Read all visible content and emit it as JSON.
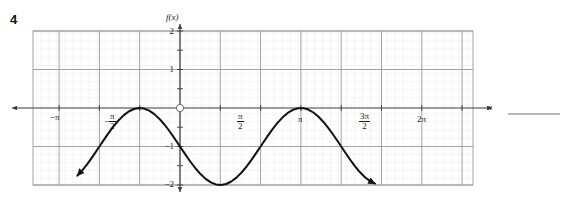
{
  "problem": {
    "number": "4",
    "answer_blank": true
  },
  "chart_data": {
    "type": "line",
    "title": "",
    "xlabel": "x",
    "ylabel": "f(x)",
    "grid": true,
    "legend": false,
    "xlim": [
      -4.0,
      7.6
    ],
    "ylim": [
      -2.0,
      2.0
    ],
    "x_tick_labels": [
      "-π",
      "-π/2",
      "π/2",
      "π",
      "3π/2",
      "2π"
    ],
    "x_tick_values": [
      -3.14159,
      -1.5708,
      1.5708,
      3.14159,
      4.71239,
      6.28319
    ],
    "y_tick_labels": [
      "2",
      "1",
      "-1",
      "-2"
    ],
    "y_tick_values": [
      2,
      1,
      -1,
      -2
    ],
    "origin_label": "O",
    "function": "f(x) = -sin(x) - 1",
    "amplitude": 1,
    "period": 6.28319,
    "vertical_shift": -1,
    "series": [
      {
        "name": "f(x)",
        "color": "#111111",
        "x": [
          -4.0,
          -3.8,
          -3.6,
          -3.4,
          -3.2,
          -3.0,
          -2.8,
          -2.6,
          -2.4,
          -2.2,
          -2.0,
          -1.8,
          -1.6,
          -1.4,
          -1.2,
          -1.0,
          -0.8,
          -0.6,
          -0.4,
          -0.2,
          0.0,
          0.2,
          0.4,
          0.6,
          0.8,
          1.0,
          1.2,
          1.4,
          1.6,
          1.8,
          2.0,
          2.2,
          2.4,
          2.6,
          2.8,
          3.0,
          3.2,
          3.4,
          3.6,
          3.8,
          4.0,
          4.2,
          4.4,
          4.6,
          4.8,
          5.0,
          5.2,
          5.4,
          5.6,
          5.8,
          6.0,
          6.2,
          6.4,
          6.6,
          6.8,
          7.0,
          7.2,
          7.4,
          7.6
        ],
        "y": [
          -1.757,
          -1.612,
          -1.443,
          -1.256,
          -1.058,
          -0.859,
          -0.665,
          -0.485,
          -0.325,
          -0.192,
          -0.091,
          -0.026,
          -0.0,
          -0.015,
          -0.068,
          -0.159,
          -0.283,
          -0.435,
          -0.611,
          -0.801,
          -1.0,
          -1.199,
          -1.389,
          -1.565,
          -1.717,
          -1.841,
          -1.932,
          -1.985,
          -2.0,
          -1.974,
          -1.909,
          -1.808,
          -1.675,
          -1.515,
          -1.335,
          -1.141,
          -0.942,
          -0.745,
          -0.557,
          -0.388,
          -0.243,
          -0.129,
          -0.049,
          -0.006,
          -0.004,
          -0.041,
          -0.117,
          -0.228,
          -0.369,
          -0.536,
          -0.721,
          -0.917,
          -1.116,
          -1.312,
          -1.495,
          -1.657,
          -1.793,
          -1.896,
          -1.963
        ]
      }
    ],
    "curve_arrow_start": true,
    "curve_arrow_end": true,
    "axis_arrow_left": true,
    "axis_arrow_right": true,
    "axis_arrow_up": true,
    "axis_arrow_down": true
  },
  "labels": {
    "x_axis_name": "x",
    "y_axis_name": "f(x)",
    "origin": "O",
    "neg_pi": "−π",
    "neg_pi_over_2_num": "π",
    "neg_pi_over_2_den": "2",
    "pi_over_2_num": "π",
    "pi_over_2_den": "2",
    "pi": "π",
    "three_pi_over_2_num": "3π",
    "three_pi_over_2_den": "2",
    "two_pi": "2π",
    "y2": "2",
    "y1": "1",
    "ym1": "−1",
    "ym2": "−2",
    "minus": "−"
  },
  "colors": {
    "curve": "#111111",
    "axis": "#3a3a3a",
    "grid_major": "#9a9a9a",
    "grid_minor": "#dcdcdc",
    "answer_line": "#b8b8b8",
    "text": "#1a1a1a",
    "background": "#ffffff"
  }
}
